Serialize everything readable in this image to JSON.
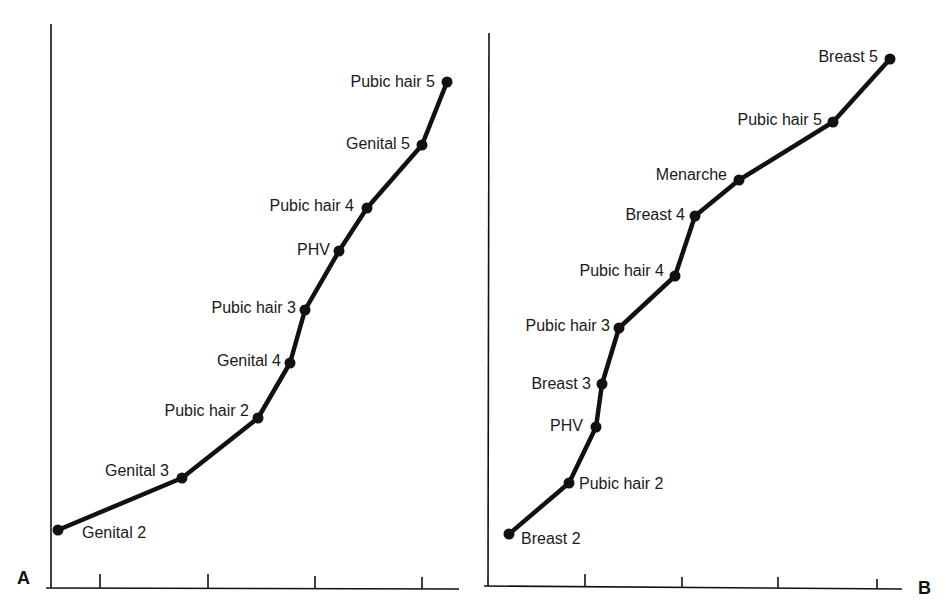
{
  "chart_data": [
    {
      "type": "line",
      "panel_label": "A",
      "title": "",
      "xlabel": "",
      "ylabel": "",
      "grid": false,
      "x_ticks_count": 4,
      "tick_labels": [],
      "points": [
        {
          "label": "Genital 2",
          "x": 0.03,
          "y": 0.11
        },
        {
          "label": "Genital 3",
          "x": 0.35,
          "y": 0.2
        },
        {
          "label": "Pubic hair 2",
          "x": 0.54,
          "y": 0.3
        },
        {
          "label": "Genital 4",
          "x": 0.62,
          "y": 0.4
        },
        {
          "label": "Pubic hair 3",
          "x": 0.66,
          "y": 0.49
        },
        {
          "label": "PHV",
          "x": 0.74,
          "y": 0.6
        },
        {
          "label": "Pubic hair 4",
          "x": 0.81,
          "y": 0.67
        },
        {
          "label": "Genital 5",
          "x": 0.95,
          "y": 0.78
        },
        {
          "label": "Pubic hair 5",
          "x": 1.01,
          "y": 0.89
        }
      ],
      "svg_points": [
        [
          58,
          530
        ],
        [
          182,
          478
        ],
        [
          258,
          418
        ],
        [
          290,
          363
        ],
        [
          305,
          310
        ],
        [
          339,
          251
        ],
        [
          367,
          208
        ],
        [
          422,
          145
        ],
        [
          447,
          82
        ]
      ],
      "label_anchor": [
        "start",
        "end",
        "end",
        "end",
        "end",
        "end",
        "end",
        "end",
        "end"
      ],
      "label_offsets": [
        [
          24,
          8
        ],
        [
          -13,
          -2
        ],
        [
          -9,
          -2
        ],
        [
          -9,
          3
        ],
        [
          -9,
          3
        ],
        [
          -9,
          4
        ],
        [
          -13,
          3
        ],
        [
          -12,
          4
        ],
        [
          -12,
          5
        ]
      ]
    },
    {
      "type": "line",
      "panel_label": "B",
      "title": "",
      "xlabel": "",
      "ylabel": "",
      "grid": false,
      "x_ticks_count": 4,
      "tick_labels": [],
      "points": [
        {
          "label": "Breast 2",
          "x": 0.05,
          "y": 0.1
        },
        {
          "label": "Pubic hair 2",
          "x": 0.2,
          "y": 0.19
        },
        {
          "label": "PHV",
          "x": 0.26,
          "y": 0.29
        },
        {
          "label": "Breast 3",
          "x": 0.28,
          "y": 0.37
        },
        {
          "label": "Pubic hair 3",
          "x": 0.32,
          "y": 0.47
        },
        {
          "label": "Pubic hair 4",
          "x": 0.45,
          "y": 0.56
        },
        {
          "label": "Breast 4",
          "x": 0.5,
          "y": 0.67
        },
        {
          "label": "Menarche",
          "x": 0.61,
          "y": 0.74
        },
        {
          "label": "Pubic hair 5",
          "x": 0.83,
          "y": 0.84
        },
        {
          "label": "Breast 5",
          "x": 0.97,
          "y": 0.95
        }
      ],
      "svg_points": [
        [
          509,
          534
        ],
        [
          569,
          483
        ],
        [
          596,
          427
        ],
        [
          602,
          384
        ],
        [
          619,
          328
        ],
        [
          675,
          276
        ],
        [
          695,
          216
        ],
        [
          739,
          180
        ],
        [
          833,
          122
        ],
        [
          890,
          59
        ]
      ],
      "label_anchor": [
        "start",
        "start",
        "end",
        "end",
        "end",
        "end",
        "end",
        "end",
        "end",
        "end"
      ],
      "label_offsets": [
        [
          12,
          10
        ],
        [
          10,
          6
        ],
        [
          -13,
          4
        ],
        [
          -11,
          5
        ],
        [
          -9,
          3
        ],
        [
          -11,
          0
        ],
        [
          -10,
          4
        ],
        [
          -12,
          0
        ],
        [
          -11,
          3
        ],
        [
          -12,
          3
        ]
      ]
    }
  ],
  "panels": {
    "a": {
      "letter": "A"
    },
    "b": {
      "letter": "B"
    }
  }
}
